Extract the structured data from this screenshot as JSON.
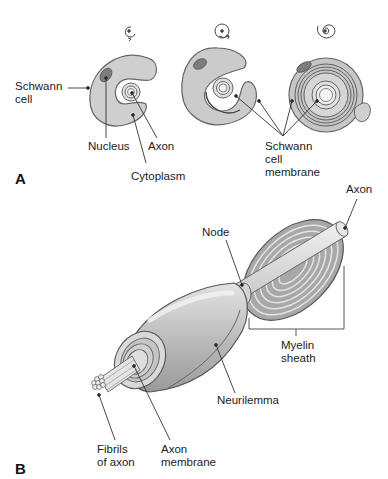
{
  "panels": {
    "a": {
      "letter": "A",
      "labels": {
        "schwann_cell": "Schwann\ncell",
        "nucleus": "Nucleus",
        "axon": "Axon",
        "cytoplasm": "Cytoplasm",
        "schwann_cell_membrane": "Schwann\ncell\nmembrane"
      },
      "stages": [
        {
          "name": "stage-1",
          "rotation_icon": "spiral-arrow-icon"
        },
        {
          "name": "stage-2",
          "rotation_icon": "spiral-arrow-icon"
        },
        {
          "name": "stage-3",
          "rotation_icon": "spiral-icon"
        }
      ]
    },
    "b": {
      "letter": "B",
      "labels": {
        "axon": "Axon",
        "node": "Node",
        "myelin_sheath": "Myelin\nsheath",
        "neurilemma": "Neurilemma",
        "fibrils_of_axon": "Fibrils\nof axon",
        "axon_membrane": "Axon\nmembrane"
      }
    }
  },
  "colors": {
    "cell_fill": "#c8c8c8",
    "cell_light": "#dcdcdc",
    "nucleus": "#7a7a7a",
    "outline": "#555555",
    "line": "#333333"
  }
}
